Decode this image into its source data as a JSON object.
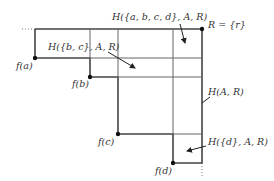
{
  "diagram": {
    "labels": {
      "h_abcd": "H({a, b, c, d}, A, R)",
      "r_set": "R = {r}",
      "h_bc": "H({b, c}, A, R)",
      "fa": "f(a)",
      "fb": "f(b)",
      "h_ar": "H(A, R)",
      "fc": "f(c)",
      "h_d": "H({d}, A, R)",
      "fd": "f(d)"
    },
    "points": {
      "r": [
        202,
        29
      ],
      "fa": [
        35,
        58
      ],
      "fb": [
        90,
        77
      ],
      "fc": [
        118,
        134
      ],
      "fd": [
        173,
        163
      ]
    },
    "colors": {
      "line": "#555555",
      "dark": "#222222"
    }
  }
}
